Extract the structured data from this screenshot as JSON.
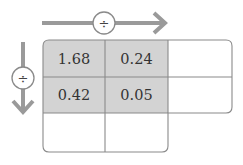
{
  "diagram": {
    "top_arrow": {
      "operator": "÷",
      "direction": "right"
    },
    "left_arrow": {
      "operator": "÷",
      "direction": "down"
    },
    "cells": [
      [
        "1.68",
        "0.24",
        ""
      ],
      [
        "0.42",
        "0.05",
        ""
      ],
      [
        "",
        "",
        null
      ]
    ],
    "colors": {
      "arrow": "#9a9a9a",
      "shaded_cell": "#d3d3d3",
      "border": "#8a8a8a",
      "text": "#333333"
    }
  }
}
